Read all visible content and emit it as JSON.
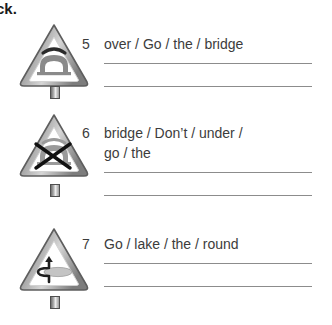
{
  "header": {
    "fragment": "ck."
  },
  "signs": [
    {
      "id": "sign-bridge-over",
      "symbol_name": "arch-bridge-icon",
      "description": "arch bridge with curved line above"
    },
    {
      "id": "sign-bridge-under-crossed",
      "symbol_name": "arch-bridge-crossed-icon",
      "description": "arch bridge with X crossed over it"
    },
    {
      "id": "sign-lake-around",
      "symbol_name": "arrow-around-lake-icon",
      "description": "arrow curving around an oval lake"
    }
  ],
  "exercises": [
    {
      "number": "5",
      "prompt_lines": [
        "over / Go / the / bridge"
      ],
      "answer_line_count": 2
    },
    {
      "number": "6",
      "prompt_lines": [
        "bridge / Don’t / under /",
        "go / the"
      ],
      "answer_line_count": 2
    },
    {
      "number": "7",
      "prompt_lines": [
        "Go / lake / the / round"
      ],
      "answer_line_count": 2
    }
  ],
  "colors": {
    "text": "#3c3c3c",
    "header_text": "#1a1a1a",
    "rule": "#8c8c8c",
    "sign_border_dark": "#6b6b6b",
    "sign_border_light": "#c9c9c9",
    "sign_fill": "#ffffff",
    "symbol": "#7e7e7e",
    "symbol_dark": "#2e2e2e"
  }
}
